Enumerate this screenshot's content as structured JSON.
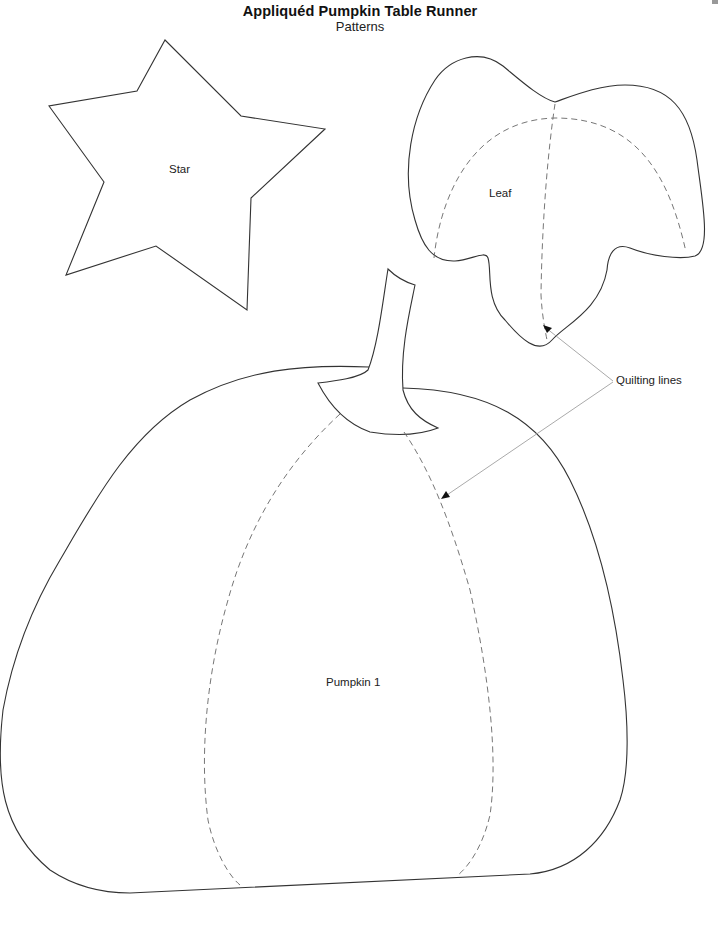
{
  "document": {
    "title": "Appliquéd Pumpkin Table Runner",
    "subtitle": "Patterns"
  },
  "patterns": [
    {
      "name": "star",
      "label": "Star"
    },
    {
      "name": "leaf",
      "label": "Leaf"
    },
    {
      "name": "pumpkin",
      "label": "Pumpkin 1"
    }
  ],
  "annotations": {
    "quilting_lines_label": "Quilting lines"
  },
  "colors": {
    "outline": "#333333",
    "quilting_line": "#666666",
    "pointer": "#aaaaaa",
    "background": "#ffffff"
  }
}
